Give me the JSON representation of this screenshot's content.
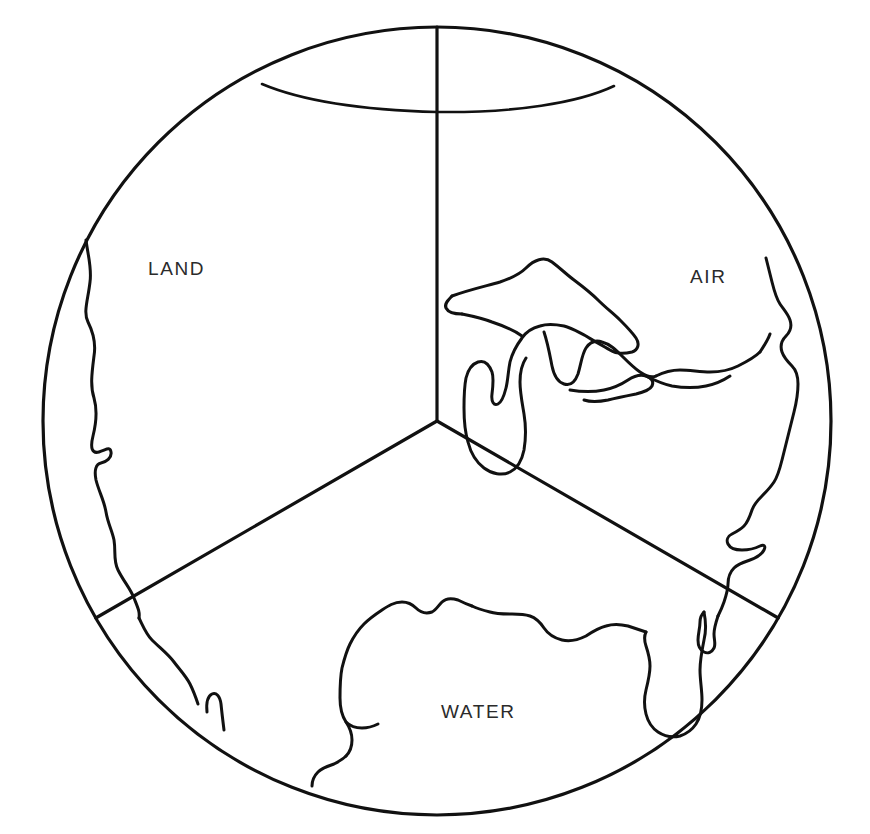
{
  "figure": {
    "kind": "venn-style-sector-diagram",
    "title_visible": false,
    "background_color": "#ffffff",
    "ink_color": "#111111",
    "width": 870,
    "height": 834
  },
  "circle": {
    "center_x": 437,
    "center_y": 421,
    "radius": 394,
    "stroke_color": "#111111"
  },
  "sectors": [
    {
      "id": "land",
      "label": "LAND",
      "label_x": 148,
      "label_y": 275,
      "start_angle_deg": 90,
      "end_angle_deg": 210,
      "description": "upper-left third"
    },
    {
      "id": "air",
      "label": "AIR",
      "label_x": 690,
      "label_y": 283,
      "start_angle_deg": 330,
      "end_angle_deg": 90,
      "description": "upper-right third"
    },
    {
      "id": "water",
      "label": "WATER",
      "label_x": 441,
      "label_y": 718,
      "start_angle_deg": 210,
      "end_angle_deg": 330,
      "description": "bottom third"
    }
  ],
  "dividers": [
    {
      "id": "divider-north",
      "from": "center",
      "to_angle_deg": 90,
      "to_x": 437,
      "to_y": 27
    },
    {
      "id": "divider-southwest",
      "from": "center",
      "to_angle_deg": 210,
      "to_x": 96,
      "to_y": 618
    },
    {
      "id": "divider-southeast",
      "from": "center",
      "to_angle_deg": 330,
      "to_x": 778,
      "to_y": 618
    }
  ],
  "overlay": {
    "name": "united-states-outline",
    "features": [
      "northern-border-49th-parallel",
      "pacific-west-coast",
      "great-lakes",
      "atlantic-east-coast",
      "florida-peninsula",
      "gulf-of-mexico-coast",
      "baja-california-tip"
    ]
  },
  "paths": {
    "north_border": "M 262 84 C 300 100, 360 110, 437 112 C 515 113, 578 103, 614 86",
    "west_coast": "M 86 240 C 88 256, 92 268, 90 282 C 88 300, 83 312, 88 322 C 93 332, 96 344, 94 356 C 92 372, 90 386, 94 398 C 98 412, 96 424, 93 436 C 90 448, 92 454, 99 452 C 106 450, 110 446, 111 452 C 112 458, 106 462, 101 463 C 96 464, 94 470, 96 480 C 99 492, 104 500, 106 512 C 108 524, 112 530, 114 540 C 116 552, 113 560, 118 570 C 124 582, 130 588, 134 598 C 138 608, 140 612, 139 618",
    "west_coast_lower": "M 139 618 C 143 626, 146 634, 152 640 C 160 648, 168 654, 174 662 C 180 670, 186 676, 190 684 C 194 692, 196 698, 198 704",
    "baja_tip": "M 207 712 C 206 702, 208 696, 212 694 C 216 692, 220 696, 221 704 C 222 714, 223 722, 224 730",
    "great_lakes": "M 452 296 C 468 290, 486 286, 500 282 C 512 278, 520 274, 526 268 C 534 260, 544 256, 552 262 C 560 268, 566 274, 574 280 C 582 286, 590 292, 598 300 C 606 308, 614 314, 620 320 C 626 326, 632 332, 636 338 C 640 344, 638 350, 632 352 C 624 354, 616 354, 610 350 C 600 344, 592 340, 586 336 C 578 332, 572 328, 564 326 C 554 324, 546 324, 540 326 C 532 328, 526 332, 522 338 C 516 346, 512 354, 510 362 C 508 372, 508 380, 506 388 C 504 396, 502 402, 498 404 C 494 406, 491 402, 492 394 C 493 386, 494 378, 492 372 C 489 364, 484 360, 478 362 C 472 364, 468 370, 466 378 C 464 388, 464 398, 464 408 C 464 420, 465 432, 468 442 C 471 454, 476 462, 484 468 C 492 474, 502 476, 510 472 C 518 468, 522 460, 524 450 C 526 438, 526 426, 524 414 C 522 402, 520 392, 520 382 C 520 372, 522 364, 526 358",
    "lake_michigan_huron": "M 544 332 C 548 344, 550 356, 552 366 C 554 376, 558 382, 564 384 C 570 386, 575 382, 578 374 C 581 364, 582 354, 586 348 C 590 342, 596 340, 602 342 C 610 344, 616 350, 622 356 C 628 362, 634 368, 640 372 C 646 376, 652 378, 656 376",
    "lake_erie_ontario": "M 570 390 C 582 392, 594 392, 604 390 C 614 388, 622 384, 628 380 C 634 376, 640 374, 646 376 C 652 378, 654 382, 652 386 C 650 390, 644 392, 636 394 C 626 396, 616 398, 608 400 C 598 402, 590 402, 584 400",
    "lakes_connector": "M 452 296 C 448 300, 444 304, 446 308 C 448 312, 454 314, 462 314",
    "superior_north": "M 462 314 C 472 316, 482 318, 492 322 C 504 326, 514 330, 522 336",
    "east_coast": "M 766 258 C 768 266, 770 274, 772 282 C 774 290, 776 298, 780 304 C 784 310, 788 314, 790 320 C 792 326, 790 332, 786 336 C 782 340, 780 346, 782 352 C 784 358, 788 362, 792 366 C 796 370, 798 376, 798 384 C 798 394, 796 404, 794 412 C 792 420, 790 428, 788 436 C 786 444, 784 452, 782 460 C 780 468, 778 476, 774 482 C 770 488, 766 492, 762 496 C 758 500, 754 504, 752 510 C 750 516, 748 522, 744 526 C 740 530, 736 532, 732 534 C 728 536, 726 540, 728 544 C 730 548, 736 550, 742 550 C 750 550, 756 548, 760 546 C 764 544, 766 546, 764 550 C 762 554, 756 558, 750 560 C 744 562, 738 564, 734 568 C 730 572, 728 578, 728 584 C 728 590, 726 596, 724 602 C 722 608, 720 612, 718 616",
    "mid_atlantic": "M 718 616 C 716 622, 714 628, 714 634 C 714 640, 716 644, 714 648 C 712 652, 708 654, 704 652 C 700 650, 698 646, 698 640 C 698 634, 700 628, 700 622 C 700 618, 702 614, 704 612",
    "midwest_top": "M 656 376 C 664 372, 672 370, 680 370 C 690 370, 700 372, 710 372 C 720 372, 730 370, 738 366 C 746 362, 754 358, 760 352",
    "appalachian_to_coast": "M 760 352 C 764 346, 768 340, 770 334",
    "great_lakes_to_ne": "M 646 376 C 654 380, 662 384, 672 386 C 684 388, 696 388, 706 386 C 716 384, 724 380, 730 376",
    "florida": "M 704 612 C 706 622, 706 632, 704 640 C 702 650, 700 660, 700 670 C 700 680, 702 690, 702 700 C 702 710, 700 718, 696 724 C 692 730, 686 734, 680 736 C 672 738, 664 736, 658 732 C 652 728, 648 722, 646 714 C 644 706, 644 698, 646 690 C 648 682, 650 674, 650 666 C 650 658, 648 652, 646 646 C 644 640, 644 636, 646 632",
    "gulf_coast": "M 646 632 C 640 630, 634 628, 628 626 C 620 624, 612 624, 606 626 C 598 628, 592 632, 586 636 C 578 640, 570 642, 562 640 C 554 638, 548 634, 544 628 C 540 622, 536 618, 530 616 C 524 614, 518 614, 512 614 C 504 614, 496 614, 490 612 C 482 610, 476 608, 472 606",
    "texas_coast": "M 472 606 C 466 604, 462 602, 458 600 C 452 598, 446 598, 442 602 C 438 606, 436 610, 432 612 C 426 614, 420 612, 416 608 C 412 604, 408 602, 402 602 C 394 602, 388 606, 382 610 C 376 614, 370 618, 364 624 C 358 630, 354 636, 350 644 C 346 652, 344 660, 342 668 C 340 678, 340 688, 340 698 C 340 708, 342 716, 346 722 C 350 728, 352 734, 352 740 C 352 746, 350 752, 346 756",
    "gulf_west_edge": "M 346 756 C 342 760, 338 762, 334 764 C 328 766, 322 768, 318 772 C 314 776, 312 780, 312 786",
    "texas_gulf_tail": "M 346 722 C 350 726, 356 728, 362 728 C 368 728, 374 726, 378 724"
  },
  "labels": {
    "land": "LAND",
    "air": "AIR",
    "water": "WATER"
  }
}
